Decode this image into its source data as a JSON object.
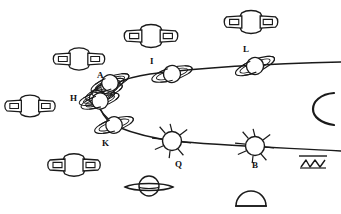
{
  "figure": {
    "background_color": "#ffffff",
    "ink_color": "#1a1a1a",
    "width": 341,
    "height": 214,
    "style": "hand-drawn line art, black ink on white"
  },
  "labels": [
    {
      "id": "A",
      "text": "A",
      "x": 97,
      "y": 71
    },
    {
      "id": "I",
      "text": "I",
      "x": 150,
      "y": 57
    },
    {
      "id": "L",
      "text": "L",
      "x": 243,
      "y": 45
    },
    {
      "id": "H",
      "text": "H",
      "x": 70,
      "y": 94
    },
    {
      "id": "K",
      "text": "K",
      "x": 102,
      "y": 139
    },
    {
      "id": "Q",
      "text": "Q",
      "x": 175,
      "y": 160
    },
    {
      "id": "B",
      "text": "B",
      "x": 252,
      "y": 161
    }
  ],
  "path_nodes": [
    {
      "id": "A",
      "label": "A",
      "cx": 110,
      "cy": 83,
      "kind": "ringed-tilted",
      "radius": 9,
      "ring_angle": -22,
      "on_path": "upper"
    },
    {
      "id": "I",
      "label": "I",
      "cx": 172,
      "cy": 74,
      "kind": "ringed-tilted",
      "radius": 9,
      "ring_angle": -16,
      "on_path": "upper"
    },
    {
      "id": "L",
      "label": "L",
      "cx": 255,
      "cy": 66,
      "kind": "ringed-tilted",
      "radius": 9,
      "ring_angle": -22,
      "on_path": "upper"
    },
    {
      "id": "H",
      "label": "H",
      "cx": 100,
      "cy": 101,
      "kind": "ringed-tilted",
      "radius": 9,
      "ring_angle": -18,
      "on_path": "cluster"
    },
    {
      "id": "K",
      "label": "K",
      "cx": 114,
      "cy": 125,
      "kind": "ringed-tilted",
      "radius": 9,
      "ring_angle": -18,
      "on_path": "lower"
    },
    {
      "id": "Q",
      "label": "Q",
      "cx": 172,
      "cy": 141,
      "kind": "spiked",
      "radius": 10,
      "ring_angle": 0,
      "on_path": "lower"
    },
    {
      "id": "B",
      "label": "B",
      "cx": 255,
      "cy": 146,
      "kind": "spiked",
      "radius": 10,
      "ring_angle": 0,
      "on_path": "lower"
    }
  ],
  "paths": [
    {
      "id": "upper-curve",
      "name": "upper orbital curve",
      "description": "sweeps from the A/H cluster up-right through I and L to the right edge"
    },
    {
      "id": "lower-curve",
      "name": "lower orbital curve",
      "description": "descends from the cluster through K, Q and B toward the right edge"
    },
    {
      "id": "connector",
      "name": "cluster connector",
      "description": "short link from the H cluster down to K"
    }
  ],
  "free_bodies": [
    {
      "id": "fb1",
      "cx": 151,
      "cy": 36,
      "rx": 25,
      "ry": 11,
      "kind": "winged-ringed",
      "note": "top centre"
    },
    {
      "id": "fb2",
      "cx": 251,
      "cy": 22,
      "rx": 25,
      "ry": 11,
      "kind": "winged-ringed",
      "note": "top right"
    },
    {
      "id": "fb3",
      "cx": 79,
      "cy": 59,
      "rx": 24,
      "ry": 11,
      "kind": "winged-ringed",
      "note": "upper left"
    },
    {
      "id": "fb4",
      "cx": 30,
      "cy": 106,
      "rx": 24,
      "ry": 11,
      "kind": "winged-ringed",
      "note": "left edge"
    },
    {
      "id": "fb5",
      "cx": 74,
      "cy": 165,
      "rx": 25,
      "ry": 11,
      "kind": "winged-ringed",
      "note": "lower left"
    },
    {
      "id": "fb6",
      "cx": 149,
      "cy": 187,
      "rx": 24,
      "ry": 9,
      "kind": "saturn-flat",
      "note": "bottom centre"
    },
    {
      "id": "fb7",
      "cx": 251,
      "cy": 198,
      "rx": 15,
      "ry": 10,
      "kind": "dome",
      "note": "bottom right semicircle"
    },
    {
      "id": "fb8",
      "cx": 320,
      "cy": 108,
      "rx": 12,
      "ry": 15,
      "kind": "arc-c",
      "note": "right edge open arc"
    },
    {
      "id": "fb9",
      "cx": 313,
      "cy": 163,
      "rx": 12,
      "ry": 6,
      "kind": "zigzag-sketch",
      "note": "bottom right scribble"
    }
  ],
  "cluster": {
    "name": "overlapping ring cluster",
    "members": 4,
    "note": "dense group of tilted-ring bodies between labels A and H"
  }
}
